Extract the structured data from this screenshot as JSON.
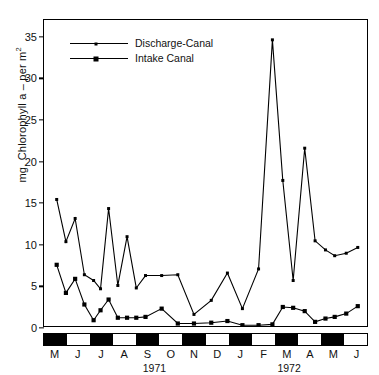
{
  "chart_data": {
    "type": "line",
    "title": "",
    "xlabel": "",
    "ylabel": "mg. Chlorophyll a – per m",
    "ylabel_sup": "2",
    "ylim": [
      0,
      37
    ],
    "yticks": [
      0,
      5,
      10,
      15,
      20,
      25,
      30,
      35
    ],
    "ytick_labels": [
      "0",
      "5",
      "10",
      "15",
      "20",
      "25",
      "30",
      "35"
    ],
    "grid": false,
    "legend_position": "top-left",
    "xlim": [
      0,
      14
    ],
    "months": [
      "M",
      "J",
      "J",
      "A",
      "S",
      "O",
      "N",
      "D",
      "J",
      "F",
      "M",
      "A",
      "M",
      "J"
    ],
    "month_shading": [
      "dark",
      "light",
      "dark",
      "light",
      "dark",
      "light",
      "dark",
      "light",
      "dark",
      "light",
      "dark",
      "light",
      "dark",
      "light"
    ],
    "year_labels": [
      {
        "label": "1971",
        "center_month_index": 4.8
      },
      {
        "label": "1972",
        "center_month_index": 10.6
      }
    ],
    "series": [
      {
        "name": "Discharge-Canal",
        "marker": "small-dot",
        "x": [
          0.55,
          0.95,
          1.35,
          1.75,
          2.15,
          2.45,
          2.8,
          3.2,
          3.6,
          4.0,
          4.4,
          5.1,
          5.8,
          6.5,
          7.25,
          7.95,
          8.6,
          9.3,
          9.9,
          10.35,
          10.8,
          11.3,
          11.75,
          12.2,
          12.6,
          13.1,
          13.6
        ],
        "values": [
          15.3,
          10.2,
          13.0,
          6.2,
          5.5,
          4.5,
          14.2,
          4.9,
          10.8,
          4.6,
          6.1,
          6.1,
          6.2,
          1.4,
          3.1,
          6.4,
          2.1,
          6.9,
          34.6,
          17.6,
          5.5,
          21.5,
          10.3,
          9.2,
          8.5,
          8.8,
          9.5
        ]
      },
      {
        "name": "Intake Canal",
        "marker": "square",
        "x": [
          0.55,
          0.95,
          1.35,
          1.75,
          2.15,
          2.45,
          2.8,
          3.2,
          3.6,
          4.0,
          4.4,
          5.1,
          5.8,
          6.5,
          7.25,
          7.95,
          8.6,
          9.3,
          9.9,
          10.35,
          10.8,
          11.3,
          11.75,
          12.2,
          12.6,
          13.1,
          13.6
        ],
        "values": [
          7.4,
          4.0,
          5.7,
          2.6,
          0.7,
          1.9,
          3.2,
          1.0,
          1.0,
          1.0,
          1.1,
          2.1,
          0.3,
          0.3,
          0.4,
          0.6,
          0.1,
          0.1,
          0.2,
          2.3,
          2.2,
          1.8,
          0.5,
          0.9,
          1.1,
          1.5,
          2.4
        ]
      }
    ]
  }
}
